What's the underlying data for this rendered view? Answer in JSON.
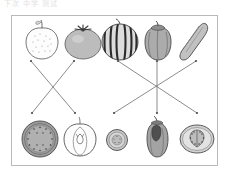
{
  "header": {
    "text": "下次  中学  测试"
  },
  "worksheet": {
    "title": "match-produce-to-cross-section",
    "card": {
      "x": 11,
      "y": 15,
      "width": 207,
      "height": 151,
      "border_color": "#b9b9b9",
      "background": "#ffffff"
    }
  },
  "palette": {
    "outline": "#4a4a4a",
    "line": "#777777",
    "apple_fill": "#fdfdfd",
    "tomato_fill": "#b8b8b8",
    "watermelon_fill": "#d8d8d8",
    "watermelon_stripe": "#2e2e2e",
    "pepper_fill": "#a8a8a8",
    "cucumber_fill": "#bdbdbd",
    "melon_slice_fill": "#9a9a9a",
    "tomato_slice_fill": "#cfcfcf"
  },
  "top_row": [
    {
      "id": "apple-whole",
      "label": "apple",
      "cx": 42,
      "cy": 42,
      "fill": "#fdfdfd"
    },
    {
      "id": "tomato-whole",
      "label": "tomato",
      "cx": 83,
      "cy": 43,
      "fill": "#b8b8b8"
    },
    {
      "id": "watermelon-whole",
      "label": "watermelon",
      "cx": 120,
      "cy": 42,
      "fill": "#d8d8d8"
    },
    {
      "id": "pepper-whole",
      "label": "bell pepper",
      "cx": 158,
      "cy": 42,
      "fill": "#a8a8a8"
    },
    {
      "id": "cucumber-whole",
      "label": "cucumber",
      "cx": 196,
      "cy": 42,
      "fill": "#bdbdbd"
    }
  ],
  "bottom_row": [
    {
      "id": "watermelon-section",
      "label": "watermelon cross-section",
      "cx": 40,
      "cy": 139,
      "fill": "#9a9a9a"
    },
    {
      "id": "apple-section",
      "label": "apple cross-section",
      "cx": 80,
      "cy": 139,
      "fill": "#fdfdfd"
    },
    {
      "id": "cucumber-section",
      "label": "cucumber cross-section",
      "cx": 117,
      "cy": 140,
      "fill": "#c4c4c4"
    },
    {
      "id": "pepper-section",
      "label": "pepper cross-section",
      "cx": 157,
      "cy": 138,
      "fill": "#a0a0a0"
    },
    {
      "id": "tomato-section",
      "label": "tomato cross-section",
      "cx": 197,
      "cy": 139,
      "fill": "#cfcfcf"
    }
  ],
  "connections": [
    {
      "id": "line-apple-to-apple-section",
      "from": "apple-whole",
      "to": "apple-section",
      "x1": 31,
      "y1": 61,
      "x2": 75,
      "y2": 113
    },
    {
      "id": "line-tomato-to-watermelon-section",
      "from": "tomato-whole",
      "to": "watermelon-section",
      "x1": 74,
      "y1": 61,
      "x2": 32,
      "y2": 113
    },
    {
      "id": "line-watermelon-to-tomato-section",
      "from": "watermelon-whole",
      "to": "tomato-section",
      "x1": 118,
      "y1": 61,
      "x2": 197,
      "y2": 113
    },
    {
      "id": "line-pepper-to-pepper-section",
      "from": "pepper-whole",
      "to": "pepper-section",
      "x1": 157,
      "y1": 61,
      "x2": 157,
      "y2": 113
    },
    {
      "id": "line-cucumber-to-cucumber-section",
      "from": "cucumber-whole",
      "to": "cucumber-section",
      "x1": 196,
      "y1": 61,
      "x2": 114,
      "y2": 113
    }
  ]
}
